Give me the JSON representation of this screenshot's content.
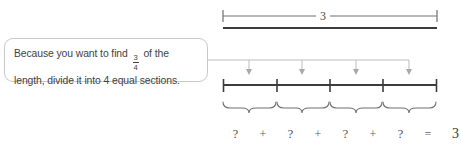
{
  "diagram": {
    "title_label": "3",
    "total_label": "3",
    "segments": 4,
    "tick_count": 5,
    "arrow_count": 4,
    "brace_count": 4
  },
  "callout": {
    "line1_prefix": "Because you want to find",
    "fraction_numerator": "3",
    "fraction_denominator": "4",
    "line1_suffix": "of the",
    "line2": "length, divide it into 4 equal sections."
  },
  "measure": {
    "length_label": "3"
  },
  "equation": {
    "terms": [
      "?",
      "?",
      "?",
      "?"
    ],
    "operators": [
      "+",
      "+",
      "+"
    ],
    "equals": "=",
    "result": "3",
    "cells": [
      {
        "kind": "term",
        "text": "?"
      },
      {
        "kind": "op",
        "text": "+"
      },
      {
        "kind": "term",
        "text": "?"
      },
      {
        "kind": "op",
        "text": "+"
      },
      {
        "kind": "term",
        "text": "?"
      },
      {
        "kind": "op",
        "text": "+"
      },
      {
        "kind": "term",
        "text": "?"
      },
      {
        "kind": "op",
        "text": "="
      },
      {
        "kind": "total",
        "text": "3"
      }
    ]
  },
  "colors": {
    "background": "#ffffff",
    "text": "#3f3f3f",
    "callout_border": "#c9c9c9",
    "number_line": "#3c3c3c",
    "measure_line": "#6e6e6e",
    "connector_line": "#bdbdbd",
    "arrow": "#a8a8a8",
    "brace": "#707070"
  }
}
